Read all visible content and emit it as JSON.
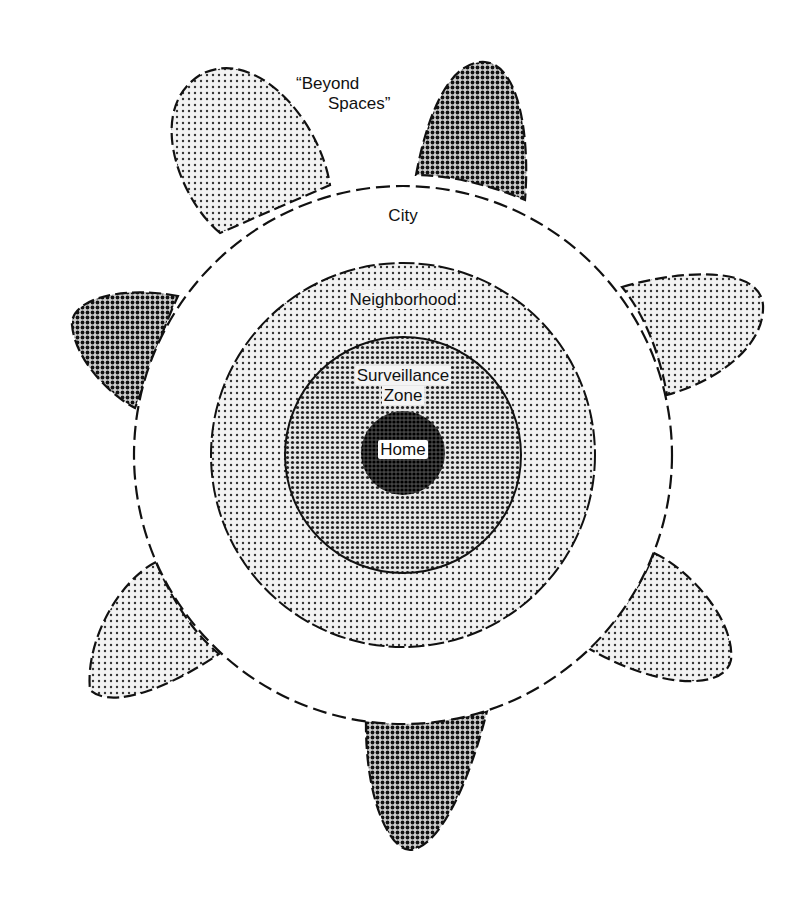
{
  "diagram": {
    "type": "concentric-zones",
    "labels": {
      "beyond_line1": "“Beyond",
      "beyond_line2": "Spaces”",
      "city": "City",
      "neighborhood": "Neighborhood",
      "surveillance_line1": "Surveillance",
      "surveillance_line2": "Zone",
      "home": "Home"
    },
    "zones": [
      {
        "name": "City",
        "border": "dashed",
        "fill": "white"
      },
      {
        "name": "Neighborhood",
        "border": "dashed",
        "fill": "light-dot-pattern"
      },
      {
        "name": "Surveillance Zone",
        "border": "solid",
        "fill": "medium-dot-pattern"
      },
      {
        "name": "Home",
        "border": "none",
        "fill": "dark-dot-pattern"
      }
    ],
    "beyond_spaces_count": 7,
    "colors": {
      "ink": "#111111",
      "light_fill": "#d6d6d6",
      "medium_fill": "#8a8a8a",
      "dark_fill": "#5a5a5a",
      "home_fill": "#1a1a1a"
    }
  }
}
